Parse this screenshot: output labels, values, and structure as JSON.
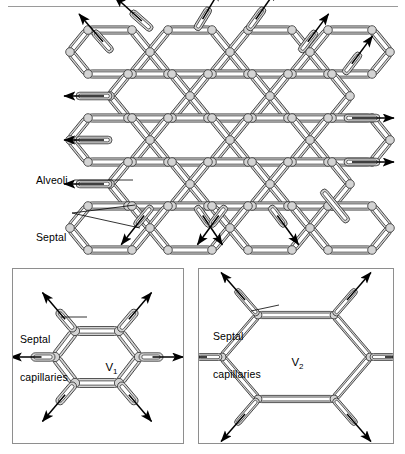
{
  "figure": {
    "title_present": false,
    "background_color": "#ffffff",
    "top_rule_color": "#9a9a9a"
  },
  "main_panel": {
    "name": "alveolar-network-overview",
    "labels": [
      {
        "id": "alveoli",
        "text": "Alveoli",
        "x": 38,
        "y": 175,
        "leader": true
      },
      {
        "id": "septal-capillaries",
        "line1": "Septal",
        "line2": "capillaries",
        "x": 39,
        "y": 210,
        "leader": true
      }
    ],
    "network": {
      "shape": "hexagonal-honeycomb",
      "wall_style": "double-line-septum",
      "capillary_fill": "#d4d4d4",
      "outline_color": "#3a3a3a",
      "columns": 5,
      "rows": 5,
      "free_edge_arrows": 14
    }
  },
  "panel_v1": {
    "name": "single-alveolus-low-volume",
    "volume_label": "V",
    "volume_subscript": "1",
    "caption": {
      "line1": "Septal",
      "line2": "capillaries"
    },
    "state": "small volume, septa short and thick relative to span",
    "arrows": 6,
    "border_color": "#8e8e8e"
  },
  "panel_v2": {
    "name": "single-alveolus-high-volume",
    "volume_label": "V",
    "volume_subscript": "2",
    "caption": {
      "line1": "Septal",
      "line2": "capillaries"
    },
    "state": "large volume, septa elongated and stretched",
    "arrows": 6,
    "border_color": "#8e8e8e"
  },
  "colors": {
    "capillary_fill": "#d4d4d4",
    "capillary_fill_light": "#e2e2e2",
    "stroke": "#3a3a3a",
    "arrow": "#000000",
    "panel_border": "#8e8e8e",
    "leader_line": "#000000"
  }
}
